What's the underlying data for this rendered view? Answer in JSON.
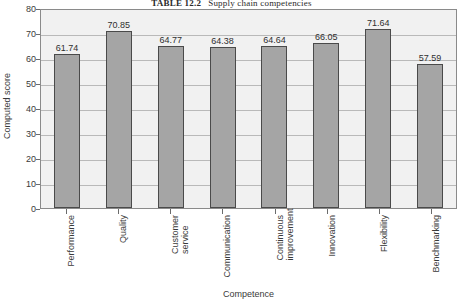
{
  "caption": {
    "label": "TABLE 12.2",
    "text": "Supply chain competencies"
  },
  "chart_data": {
    "type": "bar",
    "title": "",
    "xlabel": "Competence",
    "ylabel": "Computed score",
    "categories": [
      "Performance",
      "Quality",
      "Customer service",
      "Communication",
      "Continuous improvement",
      "Innovation",
      "Flexibility",
      "Benchmarking"
    ],
    "category_lines": [
      [
        "Performance"
      ],
      [
        "Quality"
      ],
      [
        "Customer",
        "service"
      ],
      [
        "Communication"
      ],
      [
        "Continuous",
        "improvement"
      ],
      [
        "Innovation"
      ],
      [
        "Flexibility"
      ],
      [
        "Benchmarking"
      ]
    ],
    "values": [
      61.74,
      70.85,
      64.77,
      64.38,
      64.64,
      66.05,
      71.64,
      57.59
    ],
    "value_labels": [
      "61.74",
      "70.85",
      "64.77",
      "64.38",
      "64.64",
      "66.05",
      "71.64",
      "57.59"
    ],
    "ylim": [
      0,
      80
    ],
    "yticks": [
      0,
      10,
      20,
      30,
      40,
      50,
      60,
      70,
      80
    ],
    "ytick_labels": [
      "0",
      "10",
      "20",
      "30",
      "40",
      "50",
      "60",
      "70",
      "80"
    ],
    "grid": true,
    "legend": false,
    "colors": {
      "bar_fill": "#a5a5a5",
      "bar_border": "#4a4a4a",
      "plot_background": "#f1f1f1",
      "gridline": "#b9b9b9",
      "axis": "#8a8a8a",
      "text": "#3a3a3a"
    }
  }
}
